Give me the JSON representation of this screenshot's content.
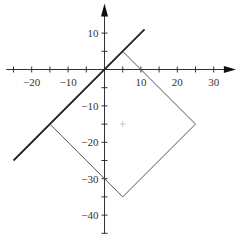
{
  "diagram": {
    "type": "coordinate-plane",
    "x_axis": {
      "ticks_labeled": [
        -20,
        -10,
        10,
        20,
        30
      ],
      "tick_labels": [
        "−20",
        "−10",
        "10",
        "20",
        "30"
      ],
      "minor_tick_step": 5,
      "range": [
        -27,
        35
      ],
      "arrow": "right"
    },
    "y_axis": {
      "ticks_labeled": [
        10,
        -10,
        -20,
        -30,
        -40
      ],
      "tick_labels": [
        "10",
        "−10",
        "−20",
        "−30",
        "−40"
      ],
      "minor_tick_step": 5,
      "range": [
        -45,
        17
      ],
      "arrow": "up"
    },
    "shapes": [
      {
        "name": "line-y-equals-x",
        "kind": "line-segment",
        "from": [
          -25,
          -25
        ],
        "to": [
          11,
          11
        ],
        "stroke": "#222222",
        "weight": "thick"
      },
      {
        "name": "rotated-square",
        "kind": "polyline",
        "points": [
          [
            -15,
            -15
          ],
          [
            5,
            -35
          ],
          [
            25,
            -15
          ],
          [
            5,
            5
          ]
        ],
        "stroke": "#555555",
        "weight": "thin",
        "note": "three visible sides; top-left side lies on the line y=x"
      },
      {
        "name": "center-marker",
        "kind": "plus-marker",
        "at": [
          5,
          -15
        ],
        "stroke": "#bbbbbb"
      }
    ]
  }
}
